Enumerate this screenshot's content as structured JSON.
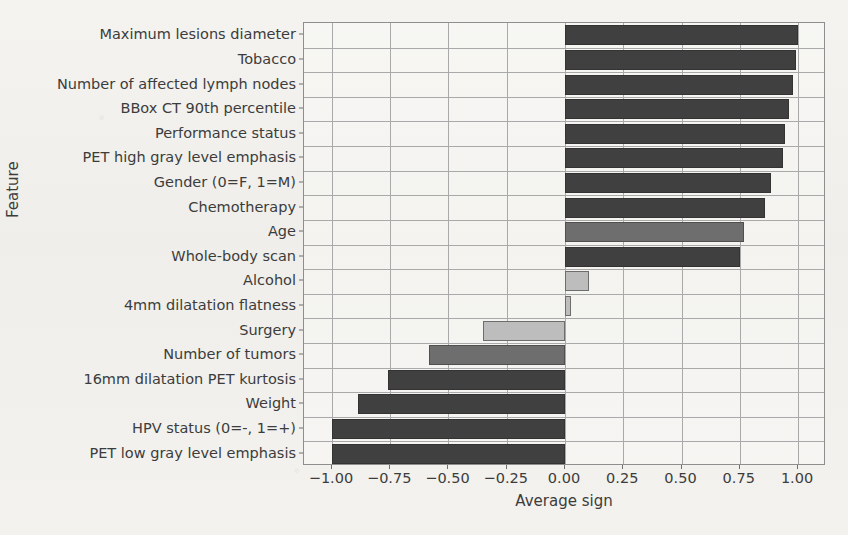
{
  "chart_data": {
    "type": "bar",
    "orientation": "horizontal",
    "title": "",
    "xlabel": "Average sign",
    "ylabel": "Feature",
    "xlim": [
      -1.12,
      1.12
    ],
    "xticks": [
      "−1.00",
      "−0.75",
      "−0.50",
      "−0.25",
      "0.00",
      "0.25",
      "0.50",
      "0.75",
      "1.00"
    ],
    "xtick_values": [
      -1.0,
      -0.75,
      -0.5,
      -0.25,
      0.0,
      0.25,
      0.5,
      0.75,
      1.0
    ],
    "grid": true,
    "legend": "none",
    "categories": [
      "Maximum lesions diameter",
      "Tobacco",
      "Number of affected lymph nodes",
      "BBox CT 90th percentile",
      "Performance status",
      "PET high gray level emphasis",
      "Gender (0=F, 1=M)",
      "Chemotherapy",
      "Age",
      "Whole-body scan",
      "Alcohol",
      "4mm dilatation flatness",
      "Surgery",
      "Number of tumors",
      "16mm dilatation PET kurtosis",
      "Weight",
      "HPV status (0=-, 1=+)",
      "PET low gray level emphasis"
    ],
    "values": [
      1.0,
      0.99,
      0.98,
      0.96,
      0.945,
      0.935,
      0.885,
      0.86,
      0.77,
      0.75,
      0.105,
      0.025,
      -0.35,
      -0.585,
      -0.76,
      -0.89,
      -1.0,
      -1.0
    ],
    "bar_shades": [
      "dark",
      "dark",
      "dark",
      "dark",
      "dark",
      "dark",
      "dark",
      "dark",
      "mid",
      "dark",
      "light",
      "light",
      "light",
      "mid",
      "dark",
      "dark",
      "dark",
      "dark"
    ],
    "colors": {
      "dark": "#404040",
      "mid": "#6e6e6e",
      "light": "#bdbdbd",
      "edge": "#4a4a4a",
      "grid": "#a9a9a9",
      "axis": "#8e8e8e",
      "background": "#f2f1ed",
      "text": "#3c3c3c"
    }
  }
}
